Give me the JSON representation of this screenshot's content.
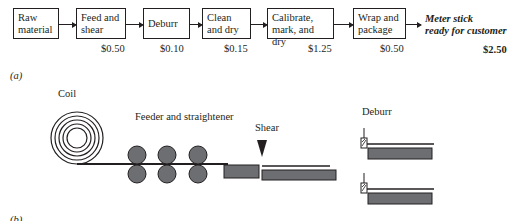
{
  "flow": {
    "steps": [
      {
        "label_line1": "Raw",
        "label_line2": "material",
        "cost": ""
      },
      {
        "label_line1": "Feed and",
        "label_line2": "shear",
        "cost": "$0.50"
      },
      {
        "label_line1": "Deburr",
        "label_line2": "",
        "cost": "$0.10"
      },
      {
        "label_line1": "Clean",
        "label_line2": "and dry",
        "cost": "$0.15"
      },
      {
        "label_line1": "Calibrate,",
        "label_line2": "mark, and dry",
        "cost": "$1.25"
      },
      {
        "label_line1": "Wrap and",
        "label_line2": "package",
        "cost": "$0.50"
      }
    ],
    "final_line1": "Meter stick",
    "final_line2": "ready for customer",
    "total": "$2.50",
    "part_label": "(a)"
  },
  "process": {
    "coil_label": "Coil",
    "feeder_label": "Feeder and straightener",
    "shear_label": "Shear",
    "deburr_label": "Deburr",
    "part_label": "(b)"
  },
  "colors": {
    "line": "#231f20",
    "fill_gray": "#6d6e71"
  }
}
